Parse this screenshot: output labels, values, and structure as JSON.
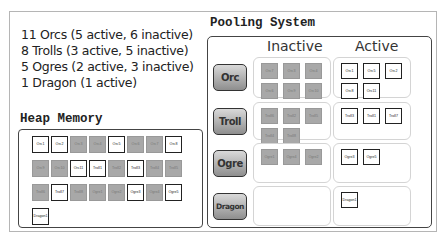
{
  "summary": {
    "lines": [
      "11 Orcs (5 active, 6 inactive)",
      "8 Trolls (3 active, 5 inactive)",
      "5 Ogres (2 active, 3 inactive)",
      "1 Dragon (1 active)"
    ]
  },
  "heap": {
    "title": "Heap Memory",
    "tiles": [
      {
        "label": "Orc1",
        "state": "active"
      },
      {
        "label": "Orc2",
        "state": "active"
      },
      {
        "label": "Orc3",
        "state": "inactive"
      },
      {
        "label": "Orc4",
        "state": "inactive"
      },
      {
        "label": "Orc5",
        "state": "active"
      },
      {
        "label": "Orc6",
        "state": "inactive"
      },
      {
        "label": "Orc7",
        "state": "inactive"
      },
      {
        "label": "Orc8",
        "state": "active"
      },
      {
        "label": "Orc9",
        "state": "inactive"
      },
      {
        "label": "Orc10",
        "state": "inactive"
      },
      {
        "label": "Orc11",
        "state": "active"
      },
      {
        "label": "Troll1",
        "state": "active"
      },
      {
        "label": "Troll2",
        "state": "inactive"
      },
      {
        "label": "Troll3",
        "state": "active"
      },
      {
        "label": "Troll4",
        "state": "inactive"
      },
      {
        "label": "Troll5",
        "state": "inactive"
      },
      {
        "label": "Troll6",
        "state": "inactive"
      },
      {
        "label": "Troll7",
        "state": "active"
      },
      {
        "label": "Troll8",
        "state": "inactive"
      },
      {
        "label": "Ogre1",
        "state": "inactive"
      },
      {
        "label": "Ogre2",
        "state": "inactive"
      },
      {
        "label": "Ogre3",
        "state": "active"
      },
      {
        "label": "Ogre4",
        "state": "inactive"
      },
      {
        "label": "Ogre5",
        "state": "active"
      },
      {
        "label": "Dragon1",
        "state": "active"
      }
    ]
  },
  "pool": {
    "title": "Pooling System",
    "columns": {
      "inactive": "Inactive",
      "active": "Active"
    },
    "types": [
      {
        "name": "Orc",
        "inactive": [
          "Orc7",
          "Orc3",
          "Orc4",
          "Orc6",
          "Orc9",
          "Orc10"
        ],
        "active": [
          "Orc1",
          "Orc5",
          "Orc2",
          "Orc8",
          "Orc11"
        ]
      },
      {
        "name": "Troll",
        "inactive": [
          "Troll6",
          "Troll2",
          "Troll5",
          "Troll4",
          "Troll8"
        ],
        "active": [
          "Troll3",
          "Troll1",
          "Troll7"
        ]
      },
      {
        "name": "Ogre",
        "inactive": [
          "Ogre1",
          "Ogre4",
          "Ogre2"
        ],
        "active": [
          "Ogre3",
          "Ogre5"
        ]
      },
      {
        "name": "Dragon",
        "inactive": [],
        "active": [
          "Dragon1"
        ]
      }
    ]
  },
  "colors": {
    "active_fill": "#ffffff",
    "inactive_fill": "#a8a8a8",
    "border": "#444444"
  }
}
